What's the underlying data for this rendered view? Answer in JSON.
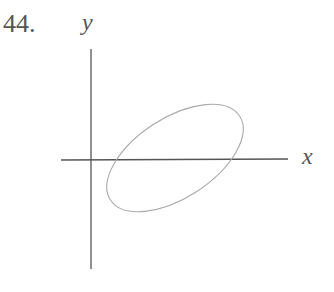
{
  "problem": {
    "number": "44."
  },
  "axes": {
    "x_label": "x",
    "y_label": "y"
  },
  "figure": {
    "colors": {
      "axes": "#555555",
      "ellipse": "#aaaaaa",
      "text": "#555555"
    }
  }
}
